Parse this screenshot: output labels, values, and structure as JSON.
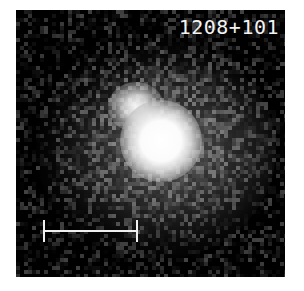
{
  "figure": {
    "object_label": "1208+101",
    "sources": [
      {
        "name": "faint-component",
        "center_px": [
          128,
          105
        ]
      },
      {
        "name": "bright-component",
        "center_px": [
          155,
          140
        ]
      }
    ],
    "scale_bar": {
      "x_start_px": 43,
      "x_end_px": 137,
      "y_px": 231,
      "color": "#f0f0f0"
    },
    "colors": {
      "background": "#050505",
      "label": "#f2f2f2",
      "page": "#ffffff"
    }
  }
}
